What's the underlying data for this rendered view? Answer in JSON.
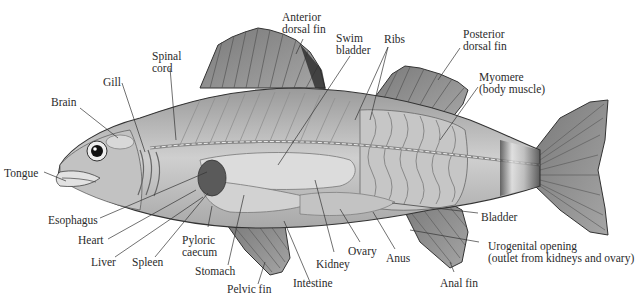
{
  "figure": {
    "colors": {
      "ink": "#2b2b2b",
      "body": "#b8b8b8",
      "fin": "#8a8a8a",
      "organ": "#d4d4d4",
      "background": "#ffffff"
    }
  },
  "labels": {
    "anterior_dorsal_fin": [
      "Anterior",
      "dorsal fin"
    ],
    "swim_bladder": [
      "Swim",
      "bladder"
    ],
    "ribs": [
      "Ribs"
    ],
    "posterior_dorsal_fin": [
      "Posterior",
      "dorsal fin"
    ],
    "myomere": [
      "Myomere",
      "(body muscle)"
    ],
    "spinal_cord": [
      "Spinal",
      "cord"
    ],
    "gill": [
      "Gill"
    ],
    "brain": [
      "Brain"
    ],
    "tongue": [
      "Tongue"
    ],
    "esophagus": [
      "Esophagus"
    ],
    "heart": [
      "Heart"
    ],
    "liver": [
      "Liver"
    ],
    "spleen": [
      "Spleen"
    ],
    "pyloric_caecum": [
      "Pyloric",
      "caecum"
    ],
    "stomach": [
      "Stomach"
    ],
    "pelvic_fin": [
      "Pelvic fin"
    ],
    "intestine": [
      "Intestine"
    ],
    "kidney": [
      "Kidney"
    ],
    "ovary": [
      "Ovary"
    ],
    "anus": [
      "Anus"
    ],
    "bladder": [
      "Bladder"
    ],
    "urogenital_opening": [
      "Urogenital opening",
      "(outlet from kidneys and ovary)"
    ],
    "anal_fin": [
      "Anal fin"
    ]
  }
}
